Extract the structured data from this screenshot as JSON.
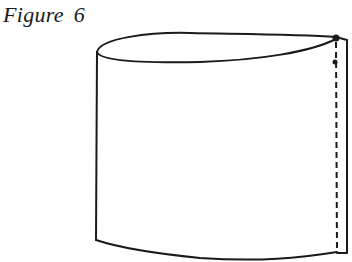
{
  "figure": {
    "caption": "Figure 6",
    "stroke_color": "#1a1a1a",
    "background": "#ffffff",
    "parts": {
      "top_opening": "ellipse",
      "body": "cylinder",
      "seam": "dashed vertical line near right edge",
      "seam_mark": "dot at top of seam"
    }
  }
}
